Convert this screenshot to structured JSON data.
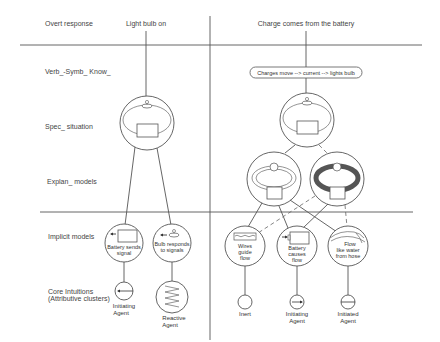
{
  "rows": {
    "overt_response": "Overt response",
    "verb_symb_know": "Verb_-Symb_ Know_",
    "spec_situation": "Spec_ situation",
    "explan_models": "Explan_ models",
    "implicit_models": "Implicit models",
    "core_intuitions_line1": "Core Intuitions",
    "core_intuitions_line2": "(Attributive clusters)"
  },
  "left_column": {
    "overt": "Light bulb on",
    "implicit": [
      {
        "line1": "Battery sends",
        "line2": "signal"
      },
      {
        "line1": "Bulb responds",
        "line2": "to signals"
      }
    ],
    "core": [
      {
        "line1": "Initiating",
        "line2": "Agent"
      },
      {
        "line1": "Reactive",
        "line2": "Agent"
      }
    ]
  },
  "right_column": {
    "overt": "Charge comes from the battery",
    "verbal": "Charges move --> current --> lights bulb",
    "implicit": [
      {
        "line1": "Wires",
        "line2": "guide",
        "line3": "flow"
      },
      {
        "line1": "Battery",
        "line2": "causes",
        "line3": "flow"
      },
      {
        "line1": "Flow",
        "line2": "like water",
        "line3": "from hose"
      }
    ],
    "core": [
      {
        "line1": "Inert",
        "line2": ""
      },
      {
        "line1": "Initiating",
        "line2": "Agent"
      },
      {
        "line1": "Initiated",
        "line2": "Agent"
      }
    ]
  },
  "colors": {
    "line": "#555555",
    "text": "#444444",
    "thick_loop": "#555555"
  }
}
